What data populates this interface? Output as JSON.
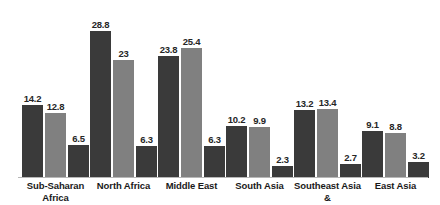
{
  "chart_data": {
    "type": "bar",
    "title": "",
    "subtitle": "",
    "xlabel": "",
    "ylabel": "",
    "ylim": [
      0,
      30.5
    ],
    "grid": false,
    "legend": "none",
    "orientation": "vertical",
    "grouping": "grouped",
    "categories": [
      "Sub-Saharan Africa",
      "North Africa",
      "Middle East",
      "South Asia",
      "Southeast Asia &",
      "East Asia"
    ],
    "category_lines": [
      [
        "Sub-Saharan",
        "Africa"
      ],
      [
        "North Africa"
      ],
      [
        "Middle East"
      ],
      [
        "South Asia"
      ],
      [
        "Southeast Asia &"
      ],
      [
        "East Asia"
      ]
    ],
    "series": [
      {
        "name": "series-1",
        "color": "#3a3a3a",
        "values": [
          14.2,
          28.8,
          23.8,
          10.2,
          13.2,
          9.1
        ],
        "labels": [
          "14.2",
          "28.8",
          "23.8",
          "10.2",
          "13.2",
          "9.1"
        ]
      },
      {
        "name": "series-2",
        "color": "#808080",
        "values": [
          12.8,
          23,
          25.4,
          9.9,
          13.4,
          8.8
        ],
        "labels": [
          "12.8",
          "23",
          "25.4",
          "9.9",
          "13.4",
          "8.8"
        ]
      },
      {
        "name": "series-3",
        "color": "#3a3a3a",
        "values": [
          6.5,
          6.3,
          6.3,
          2.3,
          2.7,
          3.2
        ],
        "labels": [
          "6.5",
          "6.3",
          "6.3",
          "2.3",
          "2.7",
          "3.2"
        ]
      }
    ],
    "axis": {
      "baseline_color": "#b7b7b7",
      "show_y_axis": false,
      "show_x_axis": true,
      "y_ticks": []
    },
    "background_color": "#ffffff",
    "label_color": "#262626"
  }
}
